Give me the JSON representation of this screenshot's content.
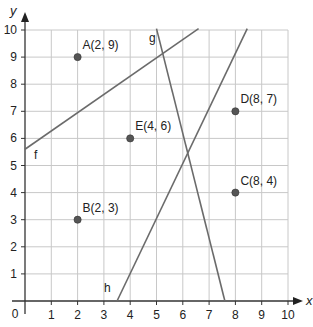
{
  "chart_data": {
    "type": "scatter",
    "title": "",
    "xlabel": "x",
    "ylabel": "y",
    "xlim": [
      0,
      10
    ],
    "ylim": [
      0,
      10
    ],
    "grid": true,
    "origin_label": "0",
    "x_ticks": [
      "1",
      "2",
      "3",
      "4",
      "5",
      "6",
      "7",
      "8",
      "9",
      "10"
    ],
    "y_ticks": [
      "1",
      "2",
      "3",
      "4",
      "5",
      "6",
      "7",
      "8",
      "9",
      "10"
    ],
    "points": [
      {
        "name": "A",
        "label": "A(2, 9)",
        "x": 2,
        "y": 9
      },
      {
        "name": "B",
        "label": "B(2, 3)",
        "x": 2,
        "y": 3
      },
      {
        "name": "C",
        "label": "C(8, 4)",
        "x": 8,
        "y": 4
      },
      {
        "name": "D",
        "label": "D(8, 7)",
        "x": 8,
        "y": 7
      },
      {
        "name": "E",
        "label": "E(4, 6)",
        "x": 4,
        "y": 6
      }
    ],
    "lines": [
      {
        "name": "f",
        "label": "f",
        "from": [
          0,
          5.6
        ],
        "to": [
          6.6,
          10.05
        ]
      },
      {
        "name": "g",
        "label": "g",
        "from": [
          5.0,
          10.05
        ],
        "to": [
          7.6,
          0
        ]
      },
      {
        "name": "h",
        "label": "h",
        "from": [
          3.5,
          0
        ],
        "to": [
          8.45,
          10.05
        ]
      }
    ],
    "colors": {
      "grid": "#c8c8c8",
      "axis": "#333333",
      "line": "#6b6b6b",
      "point": "#555555"
    }
  }
}
